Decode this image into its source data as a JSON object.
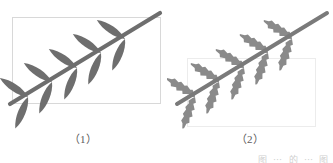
{
  "figures": [
    {
      "id": "figure-1",
      "caption": "（1）",
      "leaf_style": "smooth",
      "stem_color": "#6e6e6e",
      "leaf_color": "#6e6e6e",
      "frame_color": "#d8d8d8",
      "leaf_pairs": 5,
      "upper_leaves": 5,
      "lower_leaves": 5
    },
    {
      "id": "figure-2",
      "caption": "（2）",
      "leaf_style": "serrated",
      "stem_color": "#7a7a7a",
      "leaf_color": "#8a8a8a",
      "frame_color": "#ececec",
      "leaf_pairs": 5,
      "upper_leaves": 5,
      "lower_leaves": 5
    }
  ],
  "edge_note": {
    "text": "图 ⋯ 的 ⋯ 图"
  },
  "colors": {
    "background": "#ffffff",
    "ink": "#6e6e6e",
    "frame": "#d8d8d8"
  }
}
